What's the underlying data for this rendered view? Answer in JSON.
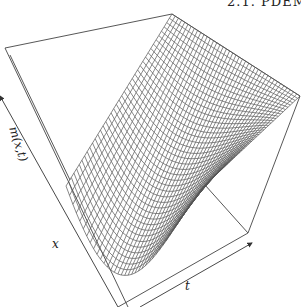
{
  "page": {
    "running_header": "2.1. PDEM"
  },
  "figure": {
    "type": "3d-surface-wireframe",
    "axes": {
      "z_label": "m(x,t)",
      "x_label": "x",
      "t_label": "t"
    },
    "mesh": {
      "u_lines": 40,
      "v_lines": 40,
      "line_color": "#555555",
      "background": "#ffffff"
    },
    "box_color": "#444444"
  }
}
